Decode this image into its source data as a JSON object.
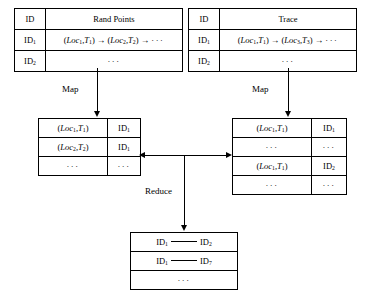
{
  "diagram": {
    "type": "mapreduce-flow",
    "tables": {
      "rand_points": {
        "name": "Rand Points table",
        "header": {
          "id": "ID",
          "content": "Rand Points"
        },
        "rows": [
          {
            "id_prefix": "ID",
            "id_sub": "1",
            "seq_prefix": "(Loc",
            "seq": "sequence-1"
          },
          {
            "id_prefix": "ID",
            "id_sub": "2",
            "seq": "···"
          }
        ]
      },
      "trace": {
        "name": "Trace table",
        "header": {
          "id": "ID",
          "content": "Trace"
        },
        "rows": [
          {
            "id_prefix": "ID",
            "id_sub": "1",
            "seq": "sequence-2"
          },
          {
            "id_prefix": "ID",
            "id_sub": "2",
            "seq": "···"
          }
        ]
      },
      "map_left": {
        "name": "Mapped Rand Points",
        "rows": [
          {
            "key": "(Loc1,T1)",
            "loc_sub": "1",
            "t_sub": "1",
            "id_prefix": "ID",
            "id_sub": "1"
          },
          {
            "key": "(Loc2,T2)",
            "loc_sub": "2",
            "t_sub": "2",
            "id_prefix": "ID",
            "id_sub": "1"
          },
          {
            "key": "···",
            "id_prefix": "···"
          }
        ]
      },
      "map_right": {
        "name": "Mapped Trace",
        "rows": [
          {
            "key": "(Loc1,T1)",
            "loc_sub": "1",
            "t_sub": "1",
            "id_prefix": "ID",
            "id_sub": "1"
          },
          {
            "key": "···",
            "id_prefix": "···"
          },
          {
            "key": "(Loc1,T1)",
            "loc_sub": "1",
            "t_sub": "1",
            "id_prefix": "ID",
            "id_sub": "2"
          },
          {
            "key": "···",
            "id_prefix": "···"
          }
        ]
      },
      "reduce": {
        "name": "Reduce output",
        "rows": [
          {
            "left_prefix": "ID",
            "left_sub": "1",
            "right_prefix": "ID",
            "right_sub": "2"
          },
          {
            "left_prefix": "ID",
            "left_sub": "1",
            "right_prefix": "ID",
            "right_sub": "7"
          },
          {
            "ellipsis": "···"
          }
        ]
      }
    },
    "labels": {
      "map_left": "Map",
      "map_right": "Map",
      "reduce": "Reduce"
    },
    "symbols": {
      "arrow": "→",
      "ellipsis": "···",
      "loc": "Loc",
      "t": "T",
      "open_paren": "(",
      "close_paren": ")",
      "comma": ","
    },
    "colors": {
      "stroke": "#000000",
      "background": "#ffffff"
    }
  }
}
